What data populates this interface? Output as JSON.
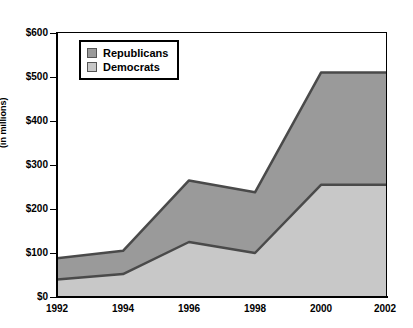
{
  "chart_data": {
    "type": "area",
    "stacked": true,
    "title": "",
    "xlabel": "",
    "ylabel": "(in millions)",
    "x": [
      1992,
      1994,
      1996,
      1998,
      2000,
      2002
    ],
    "categories": [
      "1992",
      "1994",
      "1996",
      "1998",
      "2000",
      "2002"
    ],
    "series": [
      {
        "name": "Democrats",
        "color": "#c8c8c8",
        "values": [
          40,
          52,
          125,
          100,
          255,
          255
        ]
      },
      {
        "name": "Republicans",
        "color": "#9a9a9a",
        "values": [
          48,
          53,
          140,
          138,
          255,
          255
        ]
      }
    ],
    "totals": [
      88,
      105,
      265,
      238,
      510,
      510
    ],
    "xlim": [
      1992,
      2002
    ],
    "ylim": [
      0,
      600
    ],
    "yticks": [
      0,
      100,
      200,
      300,
      400,
      500,
      600
    ],
    "ytick_labels": [
      "$0",
      "$100",
      "$200",
      "$300",
      "$400",
      "$500",
      "$600"
    ],
    "xtick_labels": [
      "1992",
      "1994",
      "1996",
      "1998",
      "2000",
      "2002"
    ],
    "grid": false,
    "legend_position": "top-left",
    "legend_entries": [
      "Republicans",
      "Democrats"
    ],
    "value_prefix": "$",
    "units": "millions"
  },
  "legend": {
    "items": [
      {
        "label": "Republicans",
        "color": "#9a9a9a"
      },
      {
        "label": "Democrats",
        "color": "#c8c8c8"
      }
    ]
  },
  "axes": {
    "y_title": "(in millions)",
    "y_labels": [
      "$600",
      "$500",
      "$400",
      "$300",
      "$200",
      "$100",
      "$0"
    ],
    "x_labels": [
      "1992",
      "1994",
      "1996",
      "1998",
      "2000",
      "2002"
    ]
  },
  "colors": {
    "republican_fill": "#9a9a9a",
    "democrat_fill": "#c8c8c8",
    "line": "#4a4a4a",
    "axis": "#000000",
    "background": "#ffffff"
  }
}
